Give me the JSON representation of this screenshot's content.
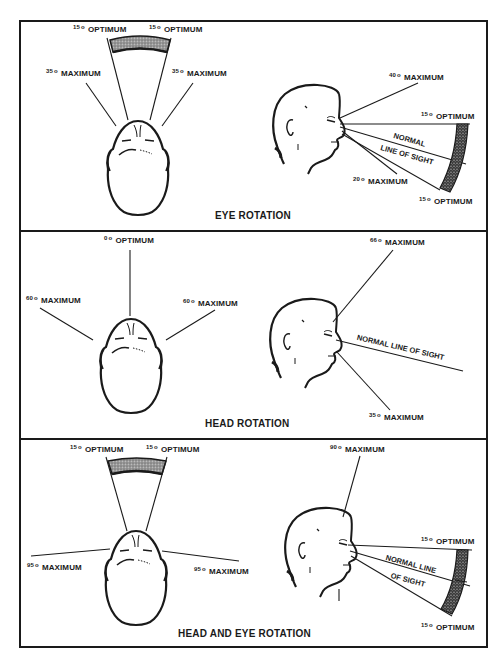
{
  "degree_symbol": "o",
  "panels": [
    {
      "caption": "EYE ROTATION",
      "top_view": {
        "left_optimum": {
          "deg": "15",
          "text": "OPTIMUM"
        },
        "right_optimum": {
          "deg": "15",
          "text": "OPTIMUM"
        },
        "left_max": {
          "deg": "35",
          "text": "MAXIMUM"
        },
        "right_max": {
          "deg": "35",
          "text": "MAXIMUM"
        }
      },
      "side_view": {
        "up_max": {
          "deg": "40",
          "text": "MAXIMUM"
        },
        "up_optimum": {
          "deg": "15",
          "text": "OPTIMUM"
        },
        "los_line1": "NORMAL",
        "los_line2": "LINE OF SIGHT",
        "down_max": {
          "deg": "20",
          "text": "MAXIMUM"
        },
        "down_optimum": {
          "deg": "15",
          "text": "OPTIMUM"
        }
      }
    },
    {
      "caption": "HEAD ROTATION",
      "top_view": {
        "center_optimum": {
          "deg": "0",
          "text": "OPTIMUM"
        },
        "left_max": {
          "deg": "60",
          "text": "MAXIMUM"
        },
        "right_max": {
          "deg": "60",
          "text": "MAXIMUM"
        }
      },
      "side_view": {
        "up_max": {
          "deg": "66",
          "text": "MAXIMUM"
        },
        "los": "NORMAL LINE OF SIGHT",
        "down_max": {
          "deg": "35",
          "text": "MAXIMUM"
        }
      }
    },
    {
      "caption": "HEAD AND EYE ROTATION",
      "top_view": {
        "left_optimum": {
          "deg": "15",
          "text": "OPTIMUM"
        },
        "right_optimum": {
          "deg": "15",
          "text": "OPTIMUM"
        },
        "left_max": {
          "deg": "95",
          "text": "MAXIMUM"
        },
        "right_max": {
          "deg": "95",
          "text": "MAXIMUM"
        }
      },
      "side_view": {
        "up_max": {
          "deg": "90",
          "text": "MAXIMUM"
        },
        "up_optimum": {
          "deg": "15",
          "text": "OPTIMUM"
        },
        "los_line1": "NORMAL LINE",
        "los_line2": "OF SIGHT",
        "down_optimum": {
          "deg": "15",
          "text": "OPTIMUM"
        }
      }
    }
  ],
  "colors": {
    "ink": "#1a1a1a",
    "shade": "#8a8a8a",
    "paper": "#ffffff"
  }
}
